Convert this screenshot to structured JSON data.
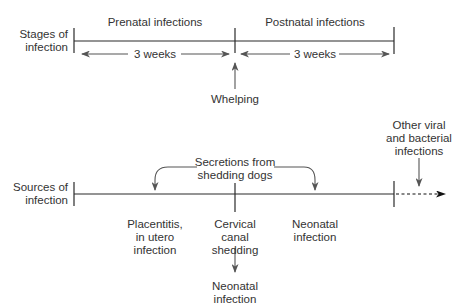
{
  "diagram": {
    "stages": {
      "row_label_line1": "Stages of",
      "row_label_line2": "infection",
      "prenatal_label": "Prenatal infections",
      "postnatal_label": "Postnatal infections",
      "prenatal_duration": "3 weeks",
      "postnatal_duration": "3 weeks",
      "event_label": "Whelping"
    },
    "sources": {
      "row_label_line1": "Sources of",
      "row_label_line2": "infection",
      "secretions_line1": "Secretions from",
      "secretions_line2": "shedding dogs",
      "placentitis_line1": "Placentitis,",
      "placentitis_line2": "in utero",
      "placentitis_line3": "infection",
      "cervical_line1": "Cervical",
      "cervical_line2": "canal",
      "cervical_line3": "shedding",
      "neonatal_mid_line1": "Neonatal",
      "neonatal_mid_line2": "infection",
      "neonatal_bottom_line1": "Neonatal",
      "neonatal_bottom_line2": "infection",
      "other_line1": "Other viral",
      "other_line2": "and bacterial",
      "other_line3": "infections"
    },
    "colors": {
      "line": "#2b2b2b",
      "arrow": "#5a5a5a",
      "text": "#333333"
    }
  }
}
